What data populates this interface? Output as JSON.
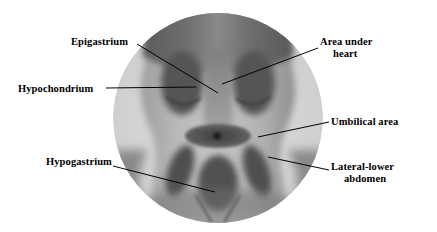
{
  "figure": {
    "background_color": "#ffffff",
    "line_color": "#000000",
    "text_color": "#000000"
  },
  "illustration": {
    "name": "abdomen-torso-grayscale",
    "description": "Grayscale photographic torso showing abdominal regions inside a light circular vignette",
    "palette": {
      "circle_light": "#d9d9d9",
      "skin_mid": "#9a9a9a",
      "skin_light": "#c4c4c4",
      "shade_dark": "#5e5e5e",
      "shade_darker": "#4a4a4a",
      "navel_dot": "#1c1c1c"
    },
    "regions": [
      {
        "name": "chest-upper",
        "tone": "#6a6a6a"
      },
      {
        "name": "epigastric-column",
        "tone": "#8d8d8d"
      },
      {
        "name": "hypochondrium-left",
        "tone": "#5a5a5a"
      },
      {
        "name": "hypochondrium-right",
        "tone": "#5a5a5a"
      },
      {
        "name": "umbilical-ellipse",
        "tone": "#5b5b5b"
      },
      {
        "name": "hypogastric-oval",
        "tone": "#565656"
      },
      {
        "name": "lateral-lower-left",
        "tone": "#545454"
      },
      {
        "name": "lateral-lower-right",
        "tone": "#545454"
      }
    ]
  },
  "labels": {
    "epigastrium": {
      "text": "Epigastrium"
    },
    "hypochondrium": {
      "text": "Hypochondrium"
    },
    "hypogastrium": {
      "text": "Hypogastrium"
    },
    "area_under_heart": {
      "line1": "Area under",
      "line2": "heart"
    },
    "umbilical_area": {
      "text": "Umbilical area"
    },
    "lateral_lower_abdomen": {
      "line1": "Lateral-lower",
      "line2": "abdomen"
    }
  },
  "leader_lines": [
    {
      "name": "leader-epigastrium",
      "from": [
        137,
        44
      ],
      "to": [
        218,
        93
      ]
    },
    {
      "name": "leader-hypochondrium",
      "from": [
        106,
        88
      ],
      "to": [
        196,
        87
      ]
    },
    {
      "name": "leader-hypogastrium",
      "from": [
        113,
        166
      ],
      "to": [
        215,
        192
      ]
    },
    {
      "name": "leader-area-under-heart",
      "from": [
        318,
        48
      ],
      "to": [
        222,
        84
      ]
    },
    {
      "name": "leader-umbilical-area",
      "from": [
        329,
        122
      ],
      "to": [
        258,
        137
      ]
    },
    {
      "name": "leader-lateral-lower-abdomen",
      "from": [
        329,
        170
      ],
      "to": [
        268,
        157
      ]
    }
  ]
}
